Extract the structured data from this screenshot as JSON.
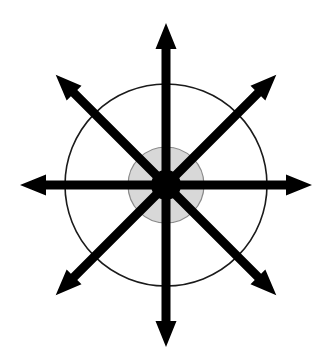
{
  "page": {
    "width": 328,
    "height": 351,
    "background_color": "#ffffff"
  },
  "caption_sliver": {
    "text": "ggyy",
    "note": "bottom descender sliver of a clipped line of text at the very top edge",
    "color": "#4a4a4a"
  },
  "figure": {
    "center": {
      "x": 166,
      "y": 185
    },
    "stroke_color": "#000000",
    "colors": {
      "arrow": "#000000",
      "hub": "#000000",
      "inner_disc_fill": "#d8d8d8",
      "inner_disc_stroke": "#8a8a8a",
      "outer_circle_stroke": "#1a1a1a",
      "background": "#ffffff"
    },
    "outer_circle": {
      "name": "outer-circle",
      "radius": 101,
      "fill": "none",
      "stroke_width": 1.6
    },
    "inner_circle": {
      "name": "inner-gray-disc",
      "radius": 38,
      "fill": "#d8d8d8",
      "stroke_width": 1.2
    },
    "hub": {
      "name": "center-hub",
      "radius": 15,
      "fill": "#000000"
    },
    "arrow_style": {
      "shaft_width": 9,
      "head_length": 26,
      "head_width": 21,
      "axis_length": 162,
      "diagonal_length": 156
    },
    "arrows": [
      {
        "name": "arrow-north",
        "label": "N",
        "angle_deg": 90,
        "length": 162,
        "tip": {
          "x": 166,
          "y": 28
        }
      },
      {
        "name": "arrow-northeast",
        "label": "NE",
        "angle_deg": 45,
        "length": 156,
        "tip": {
          "x": 274,
          "y": 68
        }
      },
      {
        "name": "arrow-east",
        "label": "E",
        "angle_deg": 0,
        "length": 146,
        "tip": {
          "x": 311,
          "y": 185
        }
      },
      {
        "name": "arrow-southeast",
        "label": "SE",
        "angle_deg": -45,
        "length": 156,
        "tip": {
          "x": 274,
          "y": 298
        }
      },
      {
        "name": "arrow-south",
        "label": "S",
        "angle_deg": -90,
        "length": 162,
        "tip": {
          "x": 166,
          "y": 347
        }
      },
      {
        "name": "arrow-southwest",
        "label": "SW",
        "angle_deg": -135,
        "length": 156,
        "tip": {
          "x": 57,
          "y": 298
        }
      },
      {
        "name": "arrow-west",
        "label": "W",
        "angle_deg": 180,
        "length": 146,
        "tip": {
          "x": 19,
          "y": 185
        }
      },
      {
        "name": "arrow-northwest",
        "label": "NW",
        "angle_deg": 135,
        "length": 156,
        "tip": {
          "x": 57,
          "y": 68
        }
      }
    ]
  }
}
